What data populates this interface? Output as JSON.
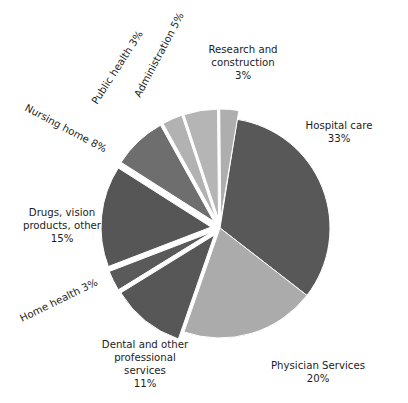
{
  "chart_data": {
    "type": "pie",
    "title": "",
    "subtitle": "",
    "xlabel": "",
    "ylabel": "",
    "legend_position": "none",
    "grid": false,
    "value_unit": "%",
    "total": 101,
    "categories": [
      "Hospital care",
      "Physician Services",
      "Dental and other professional services",
      "Home health",
      "Drugs, vision products, other",
      "Nursing home",
      "Public health",
      "Administration",
      "Research and construction"
    ],
    "values": [
      33,
      20,
      11,
      3,
      15,
      8,
      3,
      5,
      3
    ],
    "slices": [
      {
        "name": "Hospital care",
        "value": 33,
        "value_text": "33%",
        "label_line1": "Hospital care",
        "label_line2": "33%",
        "color": "#585858",
        "exploded": false,
        "start_angle": 9,
        "end_angle": 127.8,
        "label_x": 339,
        "label_y": 129,
        "label_anchor": "middle",
        "label_rotation": 0
      },
      {
        "name": "Physician Services",
        "value": 20,
        "value_text": "20%",
        "label_line1": "Physician Services",
        "label_line2": "20%",
        "color": "#ababab",
        "exploded": false,
        "start_angle": 127.8,
        "end_angle": 199.1,
        "label_x": 318,
        "label_y": 369,
        "label_anchor": "middle",
        "label_rotation": 0
      },
      {
        "name": "Dental and other professional services",
        "value": 11,
        "value_text": "11%",
        "label_line1": "Dental and other",
        "label_line2": "professional",
        "label_line3": "services",
        "label_line4": "11%",
        "color": "#575757",
        "exploded": true,
        "start_angle": 199.1,
        "end_angle": 238.3,
        "label_x": 145,
        "label_y": 348,
        "label_anchor": "middle",
        "label_rotation": 0
      },
      {
        "name": "Home health",
        "value": 3,
        "value_text": "3%",
        "label_line1": "Home health  3%",
        "color": "#5a5a5a",
        "exploded": true,
        "start_angle": 238.3,
        "end_angle": 249.0,
        "label_x": 22,
        "label_y": 322,
        "label_anchor": "start",
        "label_rotation": -26
      },
      {
        "name": "Drugs, vision products, other",
        "value": 15,
        "value_text": "15%",
        "label_line1": "Drugs, vision",
        "label_line2": "products, other",
        "label_line3": "15%",
        "color": "#565656",
        "exploded": true,
        "start_angle": 249.0,
        "end_angle": 302.5,
        "label_x": 62,
        "label_y": 216,
        "label_anchor": "middle",
        "label_rotation": 0
      },
      {
        "name": "Nursing home",
        "value": 8,
        "value_text": "8%",
        "label_line1": "Nursing home 8%",
        "color": "#6e6e6e",
        "exploded": true,
        "start_angle": 302.5,
        "end_angle": 331.0,
        "label_x": 24,
        "label_y": 110,
        "label_anchor": "start",
        "label_rotation": 28
      },
      {
        "name": "Public health",
        "value": 3,
        "value_text": "3%",
        "label_line1": "Public health 3%",
        "color": "#b2b2b2",
        "exploded": true,
        "start_angle": 331.0,
        "end_angle": 341.7,
        "label_x": 97,
        "label_y": 105,
        "label_anchor": "start",
        "label_rotation": -57
      },
      {
        "name": "Administration",
        "value": 5,
        "value_text": "5%",
        "label_line1": "Administration 5%",
        "color": "#b5b5b5",
        "exploded": true,
        "start_angle": 341.7,
        "end_angle": 359.5,
        "label_x": 140,
        "label_y": 98,
        "label_anchor": "start",
        "label_rotation": -62
      },
      {
        "name": "Research and construction",
        "value": 3,
        "value_text": "3%",
        "label_line1": "Research and",
        "label_line2": "construction",
        "label_line3": "3%",
        "color": "#aeaeae",
        "exploded": true,
        "start_angle": 359.5,
        "end_angle": 369.5,
        "label_x": 243,
        "label_y": 53,
        "label_anchor": "middle",
        "label_rotation": 0
      }
    ],
    "geometry": {
      "center_x": 220,
      "center_y": 228,
      "radius": 110,
      "explode_offset": 9
    },
    "colors": {
      "dark_gray": "#585858",
      "mid_gray": "#6e6e6e",
      "light_gray": "#b2b2b2",
      "background": "#ffffff",
      "text": "#1d1d1d"
    }
  }
}
